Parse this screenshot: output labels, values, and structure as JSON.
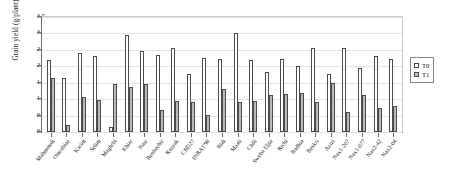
{
  "chart_data": {
    "type": "bar",
    "title": "",
    "xlabel": "",
    "ylabel": "Grain yield (g/plant)",
    "ylim": [
      0.0,
      3.5
    ],
    "ytick_labels": [
      "0.0",
      "0.5",
      "1.0",
      "1.5",
      "2.0",
      "2.5",
      "3.0",
      "3.5"
    ],
    "ytick_values": [
      0.0,
      0.5,
      1.0,
      1.5,
      2.0,
      2.5,
      3.0,
      3.5
    ],
    "grid": true,
    "legend_position": "right",
    "categories": [
      "Mahmoudi",
      "Omrabiaa",
      "Karim",
      "Selim",
      "Maghrbi",
      "Khiar",
      "Nasr",
      "Benbechir",
      "Razzak",
      "CBD27",
      "INRA1'98",
      "Bidi",
      "Maali",
      "Chili",
      "Sweba Eljia",
      "Richi",
      "Badhia",
      "Beskri",
      "Azizi",
      "Nax1-207",
      "Nax1-077",
      "Nax2-42",
      "Nax2-04"
    ],
    "series": [
      {
        "name": "T0",
        "color": "#ffffff",
        "values": [
          2.18,
          1.65,
          2.42,
          2.3,
          0.15,
          2.95,
          2.48,
          2.35,
          2.55,
          1.76,
          2.25,
          2.21,
          3.02,
          2.2,
          1.82,
          2.22,
          2.0,
          2.56,
          1.76,
          2.55,
          1.95,
          2.3,
          2.21
        ]
      },
      {
        "name": "T1",
        "color": "#b9b9b9",
        "values": [
          1.65,
          0.22,
          1.08,
          0.98,
          1.47,
          1.36,
          1.45,
          0.68,
          0.93,
          0.92,
          0.52,
          1.3,
          0.92,
          0.95,
          1.12,
          1.16,
          1.2,
          0.9,
          1.5,
          0.6,
          1.13,
          0.73,
          0.78
        ]
      }
    ]
  },
  "legend": {
    "entries": [
      {
        "label": "T0"
      },
      {
        "label": "T1"
      }
    ]
  }
}
